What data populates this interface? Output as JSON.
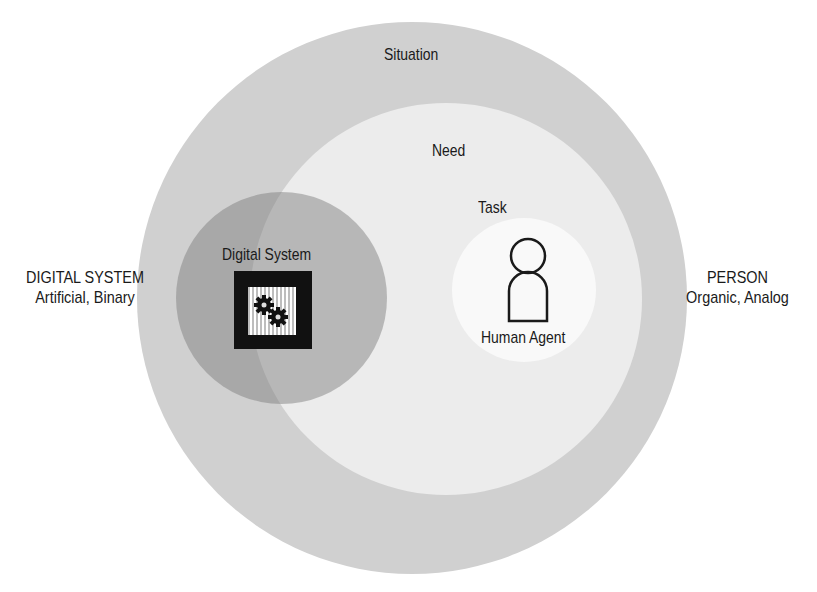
{
  "diagram": {
    "type": "nested-venn",
    "side_labels": {
      "left": {
        "title": "DIGITAL SYSTEM",
        "subtitle": "Artificial, Binary"
      },
      "right": {
        "title": "PERSON",
        "subtitle": "Organic, Analog"
      }
    },
    "regions": {
      "situation": "Situation",
      "need": "Need",
      "task": "Task",
      "digital_system": "Digital System",
      "human_agent": "Human Agent"
    },
    "icons": {
      "digital_system": "gears-binary-icon",
      "human_agent": "person-icon"
    },
    "colors": {
      "situation": "#d0d0d0",
      "need": "#ececec",
      "task": "#f9f9f9",
      "digital_system": "#9a9a9a",
      "chip": "#111111"
    }
  }
}
